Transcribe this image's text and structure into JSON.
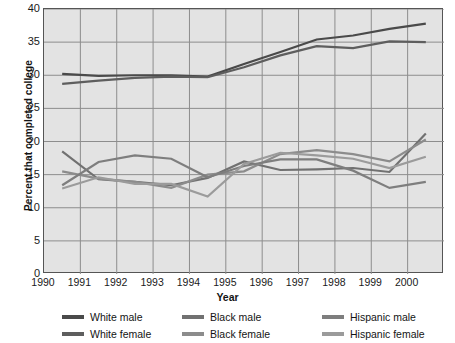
{
  "chart_data": {
    "type": "line",
    "title": "",
    "xlabel": "Year",
    "ylabel": "Percent that completed college",
    "xlim": [
      1990,
      2001
    ],
    "ylim": [
      0,
      40
    ],
    "ytick_step": 5,
    "grid": true,
    "legend_position": "bottom",
    "xticks": [
      "1990",
      "1991",
      "1992",
      "1993",
      "1994",
      "1995",
      "1996",
      "1997",
      "1998",
      "1999",
      "2000"
    ],
    "yticks": [
      "0",
      "5",
      "10",
      "15",
      "20",
      "25",
      "30",
      "35",
      "40"
    ],
    "x": [
      1990.5,
      1991.5,
      1992.5,
      1993.5,
      1994.5,
      1995.5,
      1996.5,
      1997.5,
      1998.5,
      1999.5,
      2000.5
    ],
    "series": [
      {
        "name": "White male",
        "color": "#4a4a4a",
        "values": [
          30.2,
          29.9,
          30.0,
          30.0,
          29.8,
          31.7,
          33.5,
          35.4,
          36.0,
          37.0,
          37.8
        ]
      },
      {
        "name": "White female",
        "color": "#5e5e5e",
        "values": [
          28.7,
          29.2,
          29.6,
          29.8,
          29.7,
          31.2,
          33.0,
          34.4,
          34.1,
          35.1,
          35.0
        ]
      },
      {
        "name": "Black male",
        "color": "#717171",
        "values": [
          18.5,
          14.3,
          13.9,
          13.4,
          14.5,
          17.0,
          15.7,
          15.8,
          16.0,
          15.4,
          21.2
        ]
      },
      {
        "name": "Black female",
        "color": "#8c8c8c",
        "values": [
          15.5,
          14.4,
          13.9,
          13.0,
          15.0,
          15.5,
          18.1,
          18.7,
          18.1,
          17.0,
          20.3
        ]
      },
      {
        "name": "Hispanic male",
        "color": "#7e7e7e",
        "values": [
          13.4,
          16.9,
          17.9,
          17.4,
          14.6,
          16.3,
          17.3,
          17.3,
          15.6,
          13.0,
          13.9
        ]
      },
      {
        "name": "Hispanic female",
        "color": "#9b9b9b",
        "values": [
          12.9,
          14.6,
          13.6,
          13.6,
          11.7,
          16.6,
          18.3,
          17.9,
          17.4,
          16.0,
          17.7
        ]
      }
    ]
  },
  "legend": {
    "columns": [
      {
        "items": [
          {
            "label": "White male",
            "color": "#4a4a4a"
          },
          {
            "label": "White female",
            "color": "#5e5e5e"
          }
        ]
      },
      {
        "items": [
          {
            "label": "Black male",
            "color": "#717171"
          },
          {
            "label": "Black female",
            "color": "#8c8c8c"
          }
        ]
      },
      {
        "items": [
          {
            "label": "Hispanic male",
            "color": "#7e7e7e"
          },
          {
            "label": "Hispanic female",
            "color": "#9b9b9b"
          }
        ]
      }
    ]
  },
  "style": {
    "plot_background": "#e3e3e3",
    "grid_color": "#8d8d8d",
    "axis_color": "#555555",
    "text_color": "#1a1a1a"
  }
}
